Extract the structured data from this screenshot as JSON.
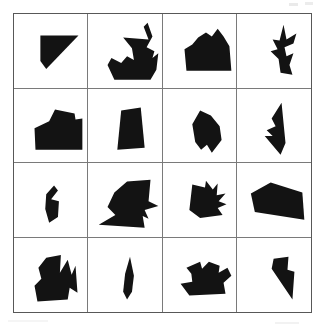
{
  "figure": {
    "title": "",
    "rows": 4,
    "columns": 4,
    "frame_color": "#585858",
    "grid_line_color": "#7a7a7a",
    "shape_color": "#131313",
    "background_color": "#ffffff"
  },
  "cells": [
    {
      "id": "r1c1",
      "row": 1,
      "column": 1,
      "shape_name": "right-triangle-wedge",
      "points": "27,22 66,22 33,56 27,48"
    },
    {
      "id": "r1c2",
      "row": 1,
      "column": 2,
      "shape_name": "sailboat-zigzag",
      "points": "45,35 36,24 62,26 57,13 61,9 66,23 60,34 68,38 66,45 72,40 70,57 64,67 27,67 20,52 24,45 34,50 40,43 47,47"
    },
    {
      "id": "r1c3",
      "row": 1,
      "column": 3,
      "shape_name": "house-mountain-pentagon",
      "points": "44,19 50,23 56,15 62,23 68,33 70,58 24,58 22,36 30,31 36,24"
    },
    {
      "id": "r1c4",
      "row": 1,
      "column": 4,
      "shape_name": "vertical-arrow-bolt",
      "points": "47,11 50,26 60,20 57,30 48,34 50,43 57,40 53,52 56,62 44,60 42,46 34,38 41,36 36,26 43,27"
    },
    {
      "id": "r2c1",
      "row": 2,
      "column": 1,
      "shape_name": "notched-block",
      "points": "42,21 62,25 63,31 70,30 70,62 22,62 21,40 36,33"
    },
    {
      "id": "r2c2",
      "row": 2,
      "column": 2,
      "shape_name": "narrow-trapezoid",
      "points": "34,22 54,19 58,60 30,62"
    },
    {
      "id": "r2c3",
      "row": 2,
      "column": 3,
      "shape_name": "angular-leaf-shield",
      "points": "38,22 49,27 58,38 60,52 50,65 45,57 39,62 33,54 30,36"
    },
    {
      "id": "r2c4",
      "row": 2,
      "column": 4,
      "shape_name": "downward-dart-spike",
      "points": "45,14 49,55 44,67 28,48 36,48 30,42 39,38 35,30"
    },
    {
      "id": "r3c1",
      "row": 3,
      "column": 1,
      "shape_name": "bent-comma",
      "points": "41,23 45,28 38,37 46,39 45,55 36,61 32,47 33,32"
    },
    {
      "id": "r3c2",
      "row": 3,
      "column": 2,
      "shape_name": "large-angular-blob-with-tail",
      "points": "40,19 64,17 62,39 72,44 58,48 62,57 56,54 58,66 11,63 28,53 20,45 27,30"
    },
    {
      "id": "r3c3",
      "row": 3,
      "column": 3,
      "shape_name": "spiky-jagged-blob",
      "points": "30,22 43,25 44,18 51,27 56,21 55,33 64,31 57,39 65,42 56,46 61,53 38,56 27,48"
    },
    {
      "id": "r3c4",
      "row": 3,
      "column": 4,
      "shape_name": "tilted-quadrilateral",
      "points": "34,20 66,30 68,58 18,50 14,31"
    },
    {
      "id": "r4c1",
      "row": 4,
      "column": 1,
      "shape_name": "zigzag-m-blob",
      "points": "33,20 48,17 47,35 55,22 59,37 63,28 65,55 57,50 55,62 24,64 21,48 28,41 25,30"
    },
    {
      "id": "r4c2",
      "row": 4,
      "column": 2,
      "shape_name": "thin-feather-blade",
      "points": "43,19 47,38 45,54 40,62 36,54 38,36"
    },
    {
      "id": "r4c3",
      "row": 4,
      "column": 3,
      "shape_name": "bird-hook-blob",
      "points": "38,24 40,31 47,24 58,28 57,35 66,30 70,38 62,45 64,56 27,58 18,46 30,44 29,36 24,30"
    },
    {
      "id": "r4c4",
      "row": 4,
      "column": 4,
      "shape_name": "descending-stepped-wedge",
      "points": "37,21 52,19 51,32 58,34 56,62 35,31"
    }
  ]
}
